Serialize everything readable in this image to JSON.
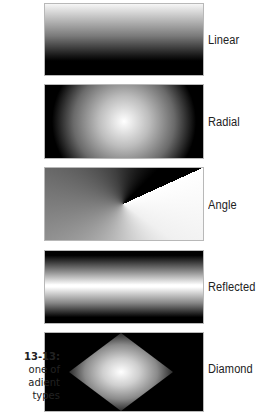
{
  "figure": {
    "caption_lines": [
      "13-13:",
      "one of",
      "adient",
      "types"
    ],
    "gradients": [
      {
        "name": "linear",
        "label": "Linear"
      },
      {
        "name": "radial",
        "label": "Radial"
      },
      {
        "name": "angle",
        "label": "Angle"
      },
      {
        "name": "reflected",
        "label": "Reflected"
      },
      {
        "name": "diamond",
        "label": "Diamond"
      }
    ]
  },
  "colors": {
    "label_text": "#222222",
    "swatch_border": "#b8b8b8",
    "gradient_start": "#ffffff",
    "gradient_end": "#000000"
  }
}
